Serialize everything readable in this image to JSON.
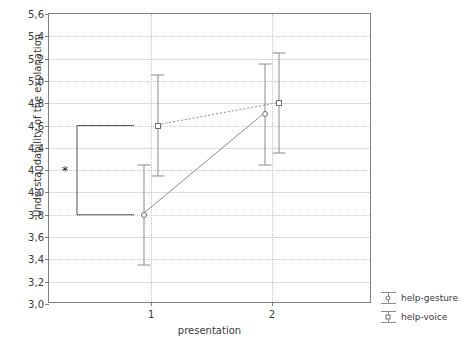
{
  "chart_data": {
    "type": "line",
    "title": "",
    "xlabel": "presentation",
    "ylabel": "Understandability of the explanation",
    "x": [
      1,
      2
    ],
    "xtick_labels": [
      "1",
      "2"
    ],
    "ylim": [
      3.0,
      5.6
    ],
    "ytick_labels": [
      "5,6",
      "5,4",
      "5,2",
      "5,0",
      "4,8",
      "4,6",
      "4,4",
      "4,2",
      "4,0",
      "3,8",
      "3,6",
      "3,4",
      "3,2",
      "3,0"
    ],
    "ytick_values": [
      5.6,
      5.4,
      5.2,
      5.0,
      4.8,
      4.6,
      4.4,
      4.2,
      4.0,
      3.8,
      3.6,
      3.4,
      3.2,
      3.0
    ],
    "grid": true,
    "legend_position": "right",
    "decimal_separator": ",",
    "series": [
      {
        "name": "help-gesture",
        "marker": "circle",
        "line_style": "solid",
        "values": [
          3.8,
          4.7
        ],
        "error_low": [
          3.35,
          4.25
        ],
        "error_high": [
          4.25,
          5.15
        ]
      },
      {
        "name": "help-voice",
        "marker": "square",
        "line_style": "dotted",
        "values": [
          4.6,
          4.8
        ],
        "error_low": [
          4.15,
          4.35
        ],
        "error_high": [
          5.05,
          5.25
        ]
      }
    ],
    "annotations": [
      {
        "type": "significance-bracket",
        "label": "*",
        "y_top": 4.6,
        "y_bottom": 3.8,
        "label_y": 4.2
      }
    ]
  },
  "legend": {
    "items": [
      {
        "label": "help-gesture",
        "marker": "circle"
      },
      {
        "label": "help-voice",
        "marker": "square"
      }
    ]
  },
  "colors": {
    "axis": "#808080",
    "grid": "#c8c8c8",
    "series_line": "#8c8c8c",
    "marker_edge": "#6e6e6e",
    "text": "#3a3a3a",
    "background": "#ffffff"
  }
}
